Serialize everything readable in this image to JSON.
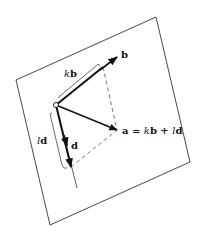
{
  "diagram": {
    "type": "vector-decomposition-in-plane",
    "plane": {
      "corners": [
        [
          16,
          80
        ],
        [
          156,
          17
        ],
        [
          190,
          162
        ],
        [
          50,
          225
        ]
      ]
    },
    "origin": [
      56,
      105
    ],
    "vectors": {
      "b": {
        "label": "b",
        "tip": [
          117,
          57
        ],
        "label_pos": [
          121,
          58
        ]
      },
      "d": {
        "label": "d",
        "tip": [
          67,
          146
        ],
        "label_pos": [
          71,
          149
        ]
      },
      "a": {
        "label_prefix": "a = ",
        "label_k": "k",
        "label_b": "b",
        "label_plus": " + ",
        "label_l": "l",
        "label_d": "d",
        "tip": [
          117,
          130
        ],
        "label_pos": [
          122,
          134
        ]
      }
    },
    "components": {
      "kb": {
        "k": "k",
        "b": "b",
        "end": [
          103,
          67
        ],
        "label_pos": [
          64,
          77
        ]
      },
      "ld": {
        "l": "l",
        "d": "d",
        "end": [
          71,
          167
        ],
        "label_pos": [
          37,
          144
        ]
      }
    },
    "d_line_end": [
      77,
      188
    ],
    "colors": {
      "line": "#222222",
      "dash": "#555555",
      "plane": "#333333"
    }
  }
}
